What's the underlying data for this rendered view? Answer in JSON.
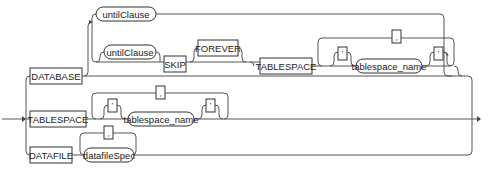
{
  "diagram": {
    "type": "railroad-syntax-diagram",
    "branches": {
      "database": {
        "keyword": "DATABASE",
        "option1": {
          "nonterminal": "untilClause"
        },
        "option2": {
          "optional_nonterminal": "untilClause",
          "keyword_skip": "SKIP",
          "optional_keyword": "FOREVER",
          "keyword_tablespace": "TABLESPACE",
          "repeat_separator": ",",
          "open_quote": "'",
          "nonterminal": "tablespace_name",
          "close_quote": "'"
        }
      },
      "tablespace": {
        "keyword": "TABLESPACE",
        "repeat_separator": ",",
        "open_quote": "'",
        "nonterminal": "tablespace_name",
        "close_quote": "'"
      },
      "datafile": {
        "keyword": "DATAFILE",
        "repeat_separator": ",",
        "nonterminal": "datafileSpec"
      }
    }
  }
}
